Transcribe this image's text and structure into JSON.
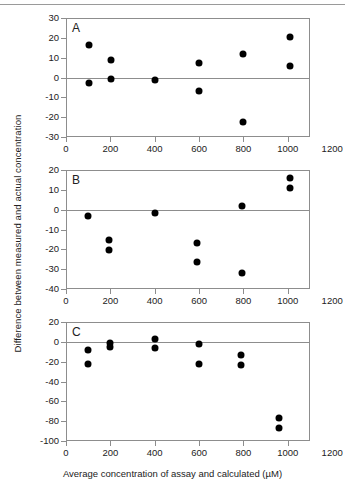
{
  "figure": {
    "top_rule": true,
    "xlabel": "Average concentration of assay and calculated (µM)",
    "ylabel": "Difference between measured and actual concentration",
    "dot_color": "#000000",
    "axis_color": "#8d8d8d"
  },
  "chart_data": [
    {
      "type": "scatter",
      "panel": "A",
      "title": "A",
      "xlabel": "Average concentration of assay and calculated (µM)",
      "ylabel": "Difference between measured and actual concentration",
      "xlim": [
        0,
        1200
      ],
      "ylim": [
        -30,
        30
      ],
      "xticks": [
        0,
        200,
        400,
        600,
        800,
        1000,
        1200
      ],
      "yticks": [
        30,
        20,
        10,
        0,
        -10,
        -20,
        -30
      ],
      "xtick_labels": [
        "0",
        "200",
        "400",
        "600",
        "800",
        "1000",
        "1200"
      ],
      "ytick_labels": [
        "30",
        "20",
        "10",
        "0",
        "-10",
        "-20",
        "-30"
      ],
      "frame_xmax": 1100,
      "grid": false,
      "zero_reference_line": 0,
      "legend": null,
      "x": [
        105,
        105,
        205,
        205,
        400,
        600,
        600,
        800,
        800,
        1010,
        1010
      ],
      "y": [
        16.5,
        -3.0,
        9.0,
        -0.7,
        -1.5,
        7.5,
        -7.0,
        11.8,
        -22.5,
        20.5,
        6.0
      ]
    },
    {
      "type": "scatter",
      "panel": "B",
      "title": "B",
      "xlabel": "Average concentration of assay and calculated (µM)",
      "ylabel": "Difference between measured and actual concentration",
      "xlim": [
        0,
        1200
      ],
      "ylim": [
        -40,
        20
      ],
      "xticks": [
        0,
        200,
        400,
        600,
        800,
        1000,
        1200
      ],
      "yticks": [
        20,
        10,
        0,
        -10,
        -20,
        -30,
        -40
      ],
      "xtick_labels": [
        "0",
        "200",
        "400",
        "600",
        "800",
        "1000",
        "1200"
      ],
      "ytick_labels": [
        "20",
        "10",
        "0",
        "-10",
        "-20",
        "-30",
        "-40"
      ],
      "frame_xmax": 1100,
      "grid": false,
      "zero_reference_line": 0,
      "legend": null,
      "x": [
        100,
        195,
        195,
        400,
        590,
        590,
        795,
        795,
        1010,
        1010
      ],
      "y": [
        -3.0,
        -15.2,
        -20.2,
        -1.5,
        -17.0,
        -26.5,
        2.0,
        -32.0,
        16.0,
        11.0
      ]
    },
    {
      "type": "scatter",
      "panel": "C",
      "title": "C",
      "xlabel": "Average concentration of assay and calculated (µM)",
      "ylabel": "Difference between measured and actual concentration",
      "xlim": [
        0,
        1200
      ],
      "ylim": [
        -100,
        20
      ],
      "xticks": [
        0,
        200,
        400,
        600,
        800,
        1000,
        1200
      ],
      "yticks": [
        20,
        0,
        -20,
        -40,
        -60,
        -80,
        -100
      ],
      "xtick_labels": [
        "0",
        "200",
        "400",
        "600",
        "800",
        "1000",
        "1200"
      ],
      "ytick_labels": [
        "20",
        "0",
        "-20",
        "-40",
        "-60",
        "-80",
        "-100"
      ],
      "frame_xmax": 1100,
      "grid": false,
      "zero_reference_line": 0,
      "legend": null,
      "x": [
        100,
        100,
        200,
        200,
        400,
        400,
        600,
        600,
        790,
        790,
        960,
        960
      ],
      "y": [
        -8.0,
        -22.0,
        -1.0,
        -5.5,
        3.0,
        -6.5,
        -2.5,
        -22.0,
        -13.0,
        -23.0,
        -77.0,
        -87.0
      ]
    }
  ]
}
